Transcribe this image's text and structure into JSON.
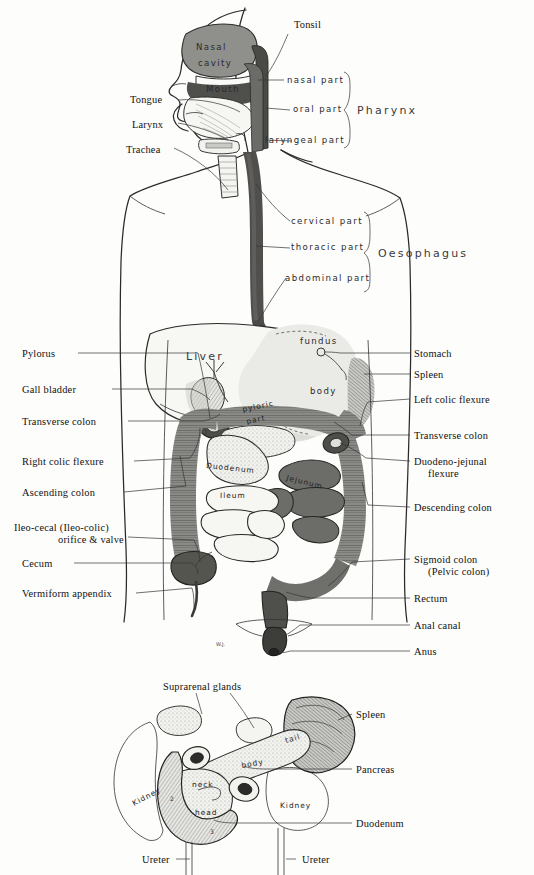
{
  "figure": {
    "signature": "W.J."
  },
  "colors": {
    "background": "#fdfdfc",
    "ink": "#1a1a1a",
    "dark_organ": "#5c5c5c",
    "mid_organ": "#8d8d8d",
    "light_organ": "#d8d8d6",
    "pale_organ": "#efefec",
    "stipple": "#b5b5b2"
  },
  "upper": {
    "left_labels": [
      {
        "text": "Tongue",
        "x": 130,
        "y": 103
      },
      {
        "text": "Larynx",
        "x": 132,
        "y": 125
      },
      {
        "text": "Trachea",
        "x": 126,
        "y": 150
      }
    ],
    "top_label": {
      "text": "Tonsil",
      "x": 294,
      "y": 28
    },
    "pharynx_parts": [
      {
        "text": "nasal part",
        "x": 287,
        "y": 80
      },
      {
        "text": "oral part",
        "x": 293,
        "y": 110
      },
      {
        "text": "laryngeal part",
        "x": 268,
        "y": 141
      }
    ],
    "pharynx_bracket_label": {
      "text": "Pharynx",
      "x": 359,
      "y": 110
    },
    "oesophagus_parts": [
      {
        "text": "cervical part",
        "x": 293,
        "y": 221
      },
      {
        "text": "thoracic part",
        "x": 293,
        "y": 248
      },
      {
        "text": "abdominal part",
        "x": 287,
        "y": 278
      }
    ],
    "oesophagus_bracket_label": {
      "text": "Oesophagus",
      "x": 382,
      "y": 253
    },
    "head_labels": [
      {
        "text": "Nasal",
        "x": 196,
        "y": 47
      },
      {
        "text": "cavity",
        "x": 198,
        "y": 63
      },
      {
        "text": "Mouth",
        "x": 208,
        "y": 89
      }
    ]
  },
  "abdomen": {
    "left_labels": [
      {
        "text": "Pylorus",
        "x": 22,
        "y": 356
      },
      {
        "text": "Gall bladder",
        "x": 22,
        "y": 392
      },
      {
        "text": "Transverse colon",
        "x": 22,
        "y": 424
      },
      {
        "text": "Right colic flexure",
        "x": 22,
        "y": 464
      },
      {
        "text": "Ascending colon",
        "x": 22,
        "y": 495
      },
      {
        "text": "Ileo-cecal (Ileo-colic)",
        "x": 14,
        "y": 529
      },
      {
        "text": "orifice & valve",
        "x": 60,
        "y": 541
      },
      {
        "text": "Cecum",
        "x": 22,
        "y": 566
      },
      {
        "text": "Vermiform appendix",
        "x": 22,
        "y": 596
      }
    ],
    "right_labels": [
      {
        "text": "Stomach",
        "x": 414,
        "y": 356
      },
      {
        "text": "Spleen",
        "x": 414,
        "y": 377
      },
      {
        "text": "Left colic flexure",
        "x": 414,
        "y": 402
      },
      {
        "text": "Transverse colon",
        "x": 414,
        "y": 438
      },
      {
        "text": "Duodeno-jejunal",
        "x": 414,
        "y": 464
      },
      {
        "text": "flexure",
        "x": 428,
        "y": 476
      },
      {
        "text": "Descending colon",
        "x": 414,
        "y": 510
      },
      {
        "text": "Sigmoid colon",
        "x": 414,
        "y": 562
      },
      {
        "text": "(Pelvic colon)",
        "x": 428,
        "y": 574
      },
      {
        "text": "Rectum",
        "x": 414,
        "y": 601
      },
      {
        "text": "Anal canal",
        "x": 414,
        "y": 628
      },
      {
        "text": "Anus",
        "x": 414,
        "y": 654
      }
    ],
    "figure_labels": [
      {
        "text": "Liver",
        "x": 190,
        "y": 356,
        "size": "lg"
      },
      {
        "text": "fundus",
        "x": 302,
        "y": 341,
        "size": "md"
      },
      {
        "text": "body",
        "x": 314,
        "y": 390,
        "size": "md"
      },
      {
        "text": "pyloric",
        "x": 245,
        "y": 410,
        "size": "sm"
      },
      {
        "text": "part",
        "x": 249,
        "y": 422,
        "size": "sm"
      },
      {
        "text": "Duodenum",
        "x": 208,
        "y": 466,
        "size": "sm"
      },
      {
        "text": "Jejunum",
        "x": 288,
        "y": 477,
        "size": "sm"
      },
      {
        "text": "Ileum",
        "x": 222,
        "y": 495,
        "size": "sm"
      }
    ]
  },
  "lower": {
    "top_label": {
      "text": "Suprarenal glands",
      "x": 163,
      "y": 687
    },
    "right_labels": [
      {
        "text": "Spleen",
        "x": 356,
        "y": 717
      },
      {
        "text": "Pancreas",
        "x": 356,
        "y": 772
      },
      {
        "text": "Duodenum",
        "x": 356,
        "y": 826
      }
    ],
    "bottom_labels": [
      {
        "text": "Ureter",
        "x": 142,
        "y": 862
      },
      {
        "text": "Ureter",
        "x": 302,
        "y": 862
      }
    ],
    "figure_labels": [
      {
        "text": "tail",
        "x": 290,
        "y": 740
      },
      {
        "text": "body",
        "x": 246,
        "y": 765
      },
      {
        "text": "neck",
        "x": 196,
        "y": 784
      },
      {
        "text": "head",
        "x": 199,
        "y": 812
      },
      {
        "text": "Kidney",
        "x": 140,
        "y": 802
      },
      {
        "text": "Kidney",
        "x": 284,
        "y": 805
      }
    ],
    "duodenum_numbers": [
      {
        "text": "1",
        "x": 180,
        "y": 761
      },
      {
        "text": "2",
        "x": 172,
        "y": 799
      },
      {
        "text": "3",
        "x": 212,
        "y": 832
      }
    ]
  }
}
